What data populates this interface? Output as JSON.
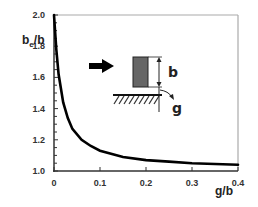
{
  "chart_data": {
    "type": "line",
    "title": "",
    "xlabel": "g/b",
    "ylabel": "b_e/b",
    "ylabel_main": "b",
    "ylabel_sub": "e",
    "ylabel_tail": "/b",
    "xlim": [
      0,
      0.4
    ],
    "ylim": [
      1.0,
      2.0
    ],
    "grid": false,
    "legend": null,
    "x_ticks": [
      "0",
      "0.1",
      "0.2",
      "0.3",
      "0.4"
    ],
    "y_ticks": [
      "1.0",
      "1.2",
      "1.4",
      "1.6",
      "1.8",
      "2.0"
    ],
    "series": [
      {
        "name": "b_e/b vs g/b",
        "x": [
          0.0,
          0.005,
          0.01,
          0.02,
          0.03,
          0.04,
          0.06,
          0.08,
          0.1,
          0.15,
          0.2,
          0.25,
          0.3,
          0.35,
          0.4
        ],
        "y": [
          2.0,
          1.78,
          1.62,
          1.44,
          1.34,
          1.27,
          1.2,
          1.16,
          1.13,
          1.09,
          1.07,
          1.06,
          1.05,
          1.045,
          1.04
        ]
      }
    ],
    "annotations": {
      "inset_labels": [
        "b",
        "g"
      ],
      "inset_description": "Flow arrow pointing at a gray rectangular block of height b positioned a gap g above a hatched wall"
    }
  },
  "colors": {
    "curve": "#000000",
    "axis": "#333333",
    "frame": "#aaaaaa",
    "block": "#666666",
    "hatch": "#333333"
  }
}
